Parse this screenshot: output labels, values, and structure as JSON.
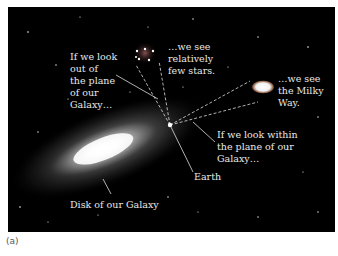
{
  "figure": {
    "caption": "(a)",
    "labels": {
      "look_out": "If we look\nout of\nthe plane\nof our\nGalaxy…",
      "few_stars": "…we see\nrelatively\nfew stars.",
      "milky_way": "…we see\nthe Milky\nWay.",
      "look_within": "If we look within\nthe plane of our\nGalaxy…",
      "earth": "Earth",
      "disk": "Disk of our Galaxy"
    },
    "colors": {
      "background": "#000000",
      "text": "#e8e8e8",
      "caption": "#555555"
    }
  }
}
